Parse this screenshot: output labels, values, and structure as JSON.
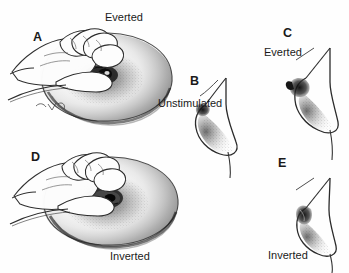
{
  "figure": {
    "background_color": "#fefefe",
    "ink_color": "#1a1a1a",
    "width": 349,
    "height": 273
  },
  "labels": {
    "everted_top": "Everted",
    "inverted_bottom": "Inverted",
    "unstimulated": "Unstimulated",
    "everted_c": "Everted",
    "inverted_e": "Inverted"
  },
  "panels": [
    {
      "letter": "A",
      "caption": "Everted",
      "content": "hand-compressing-areola",
      "description": "Hand pinching areola, nipple protrudes outward"
    },
    {
      "letter": "B",
      "caption": "Unstimulated",
      "content": "breast-profile-unstimulated",
      "description": "Side profile of unstimulated breast"
    },
    {
      "letter": "C",
      "caption": "Everted",
      "content": "breast-profile-everted",
      "description": "Side profile with protruding everted nipple"
    },
    {
      "letter": "D",
      "caption": "Inverted",
      "content": "hand-compressing-areola",
      "description": "Hand pinching areola, nipple retracts inward"
    },
    {
      "letter": "E",
      "caption": "Inverted",
      "content": "breast-profile-inverted",
      "description": "Side profile with retracted inverted nipple"
    }
  ]
}
